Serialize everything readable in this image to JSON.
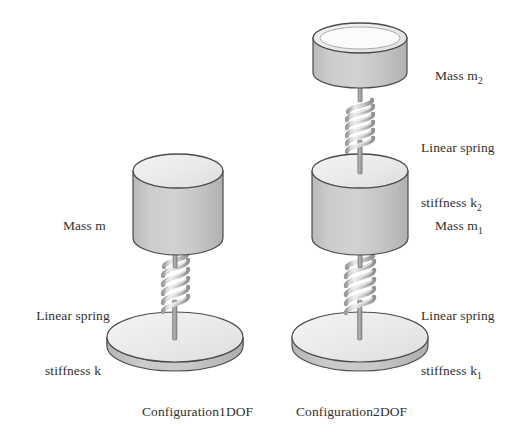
{
  "page": {
    "background_color": "#ffffff"
  },
  "palette": {
    "body_fill": "#c6c6c6",
    "body_fill_light": "#d4d4d4",
    "top_face_fill": "#eeeeee",
    "outline": "#4a4a4a",
    "spring_stroke": "#8c8c8c",
    "spring_light": "#e4e4e4",
    "rod_fill": "#9a9a9a",
    "text_color": "#33302f"
  },
  "configurations": {
    "one_dof": {
      "caption": "Configuration1DOF",
      "mass_label": "Mass m",
      "mass_symbol": "m",
      "spring_label_line1": "Linear spring",
      "spring_label_line2": "stiffness k",
      "spring_symbol": "k",
      "coil_count": 6
    },
    "two_dof": {
      "caption": "Configuration2DOF",
      "upper_mass_label": "Mass m",
      "upper_mass_subscript": "2",
      "upper_spring_line1": "Linear spring",
      "upper_spring_line2": "stiffness k",
      "upper_spring_subscript": "2",
      "lower_mass_label": "Mass m",
      "lower_mass_subscript": "1",
      "lower_spring_line1": "Linear spring",
      "lower_spring_line2": "stiffness k",
      "lower_spring_subscript": "1",
      "coil_count": 6
    }
  }
}
